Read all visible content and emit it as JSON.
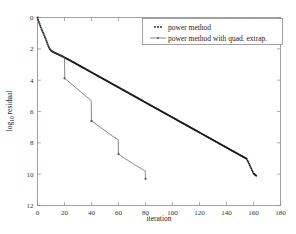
{
  "chart_data": {
    "type": "line",
    "title": "",
    "xlabel": "iteration",
    "ylabel": "log10 residual",
    "ylabel_main": "log",
    "ylabel_sub": "10",
    "ylabel_tail": " residual",
    "xlim": [
      0,
      180
    ],
    "ylim": [
      12,
      0
    ],
    "y_inverted": true,
    "grid": false,
    "xticks": [
      0,
      20,
      40,
      60,
      80,
      100,
      120,
      140,
      160,
      180
    ],
    "xtick_labels": [
      "0",
      "20",
      "40",
      "60",
      "80",
      "100",
      "120",
      "140",
      "160",
      "180"
    ],
    "yticks": [
      0,
      2,
      4,
      6,
      8,
      10,
      12
    ],
    "ytick_labels": [
      "0",
      "2",
      "4",
      "6",
      "8",
      "10",
      "12"
    ],
    "legend_position": "upper right",
    "series": [
      {
        "name": "power method",
        "marker": "dot",
        "style": "dotted-dense",
        "color": "#1a1a1a",
        "points": [
          [
            0,
            0.0
          ],
          [
            1,
            -0.28
          ],
          [
            2,
            -0.52
          ],
          [
            3,
            -0.74
          ],
          [
            4,
            -0.95
          ],
          [
            5,
            -1.14
          ],
          [
            6,
            -1.35
          ],
          [
            7,
            -1.58
          ],
          [
            8,
            -1.82
          ],
          [
            9,
            -2.0
          ],
          [
            10,
            -2.1
          ],
          [
            11,
            -2.17
          ],
          [
            12,
            -2.22
          ],
          [
            14,
            -2.3
          ],
          [
            16,
            -2.38
          ],
          [
            18,
            -2.46
          ],
          [
            20,
            -2.55
          ],
          [
            25,
            -2.78
          ],
          [
            30,
            -3.02
          ],
          [
            35,
            -3.26
          ],
          [
            40,
            -3.5
          ],
          [
            45,
            -3.74
          ],
          [
            50,
            -3.98
          ],
          [
            55,
            -4.22
          ],
          [
            60,
            -4.46
          ],
          [
            65,
            -4.7
          ],
          [
            70,
            -4.94
          ],
          [
            75,
            -5.18
          ],
          [
            80,
            -5.42
          ],
          [
            85,
            -5.66
          ],
          [
            90,
            -5.9
          ],
          [
            95,
            -6.14
          ],
          [
            100,
            -6.38
          ],
          [
            105,
            -6.62
          ],
          [
            110,
            -6.86
          ],
          [
            115,
            -7.1
          ],
          [
            120,
            -7.34
          ],
          [
            125,
            -7.58
          ],
          [
            130,
            -7.82
          ],
          [
            135,
            -8.06
          ],
          [
            140,
            -8.3
          ],
          [
            145,
            -8.54
          ],
          [
            150,
            -8.78
          ],
          [
            155,
            -9.02
          ],
          [
            160,
            -9.95
          ],
          [
            162,
            -10.1
          ]
        ]
      },
      {
        "name": "power method with quad. extrap.",
        "marker": "line",
        "style": "solid-thin",
        "color": "#555555",
        "points": [
          [
            0,
            0.0
          ],
          [
            2,
            -0.52
          ],
          [
            4,
            -0.95
          ],
          [
            6,
            -1.35
          ],
          [
            8,
            -1.82
          ],
          [
            10,
            -2.1
          ],
          [
            12,
            -2.22
          ],
          [
            14,
            -2.3
          ],
          [
            16,
            -2.38
          ],
          [
            18,
            -2.46
          ],
          [
            20,
            -2.55
          ],
          [
            20.2,
            -3.88
          ],
          [
            24,
            -4.16
          ],
          [
            28,
            -4.45
          ],
          [
            32,
            -4.74
          ],
          [
            36,
            -5.03
          ],
          [
            39.8,
            -5.3
          ],
          [
            40,
            -6.6
          ],
          [
            44,
            -6.85
          ],
          [
            48,
            -7.1
          ],
          [
            52,
            -7.35
          ],
          [
            56,
            -7.6
          ],
          [
            59.8,
            -7.8
          ],
          [
            60,
            -8.72
          ],
          [
            64,
            -8.95
          ],
          [
            68,
            -9.18
          ],
          [
            72,
            -9.4
          ],
          [
            76,
            -9.6
          ],
          [
            79.8,
            -9.8
          ],
          [
            80,
            -10.3
          ]
        ],
        "jumps": [
          {
            "iteration": 20,
            "from": -2.55,
            "to": -3.88
          },
          {
            "iteration": 40,
            "from": -5.3,
            "to": -6.6
          },
          {
            "iteration": 60,
            "from": -7.8,
            "to": -8.72
          },
          {
            "iteration": 80,
            "from": -9.8,
            "to": -10.3
          }
        ]
      }
    ],
    "legend_entries": [
      {
        "label": "power method",
        "marker": "dot",
        "color": "#1a1a1a"
      },
      {
        "label": "power method with quad. extrap.",
        "marker": "line-dot",
        "color": "#555555"
      }
    ]
  },
  "figure": {
    "background_color": "#ffffff",
    "frame_color": "#8a8a8a"
  }
}
